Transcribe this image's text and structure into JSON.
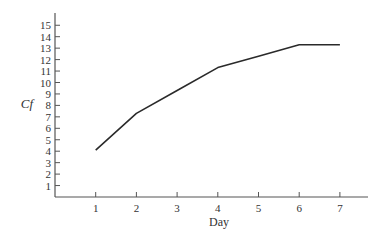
{
  "chart_data": {
    "type": "line",
    "title": "",
    "xlabel": "Day",
    "ylabel": "Cf",
    "x": [
      1,
      2,
      3,
      4,
      5,
      6,
      7
    ],
    "series": [
      {
        "name": "Cf",
        "values": [
          4.1,
          7.3,
          9.3,
          11.3,
          12.3,
          13.3,
          13.3
        ]
      }
    ],
    "vertices": [
      [
        1,
        4.1
      ],
      [
        2,
        7.3
      ],
      [
        4,
        11.3
      ],
      [
        6,
        13.3
      ],
      [
        7,
        13.3
      ]
    ],
    "xticks": [
      "1",
      "2",
      "3",
      "4",
      "5",
      "6",
      "7"
    ],
    "yticks": [
      "1",
      "2",
      "3",
      "4",
      "5",
      "6",
      "7",
      "8",
      "9",
      "10",
      "11",
      "12",
      "13",
      "14",
      "15"
    ],
    "xlim": [
      0,
      7.7
    ],
    "ylim": [
      0,
      16
    ],
    "grid": false,
    "legend": null,
    "colors": {
      "line": "#2a2a2a",
      "axis": "#555555",
      "text": "#333333"
    }
  }
}
